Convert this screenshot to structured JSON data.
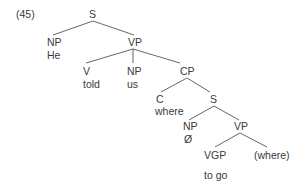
{
  "example_number": "(45)",
  "tree": {
    "S": {
      "label": "S"
    },
    "NP_subject": {
      "label": "NP",
      "word": "He"
    },
    "VP": {
      "label": "VP"
    },
    "V": {
      "label": "V",
      "word": "told"
    },
    "NP_object": {
      "label": "NP",
      "word": "us"
    },
    "CP": {
      "label": "CP"
    },
    "C": {
      "label": "C",
      "word": "where"
    },
    "S_embedded": {
      "label": "S"
    },
    "NP_null": {
      "label": "NP",
      "word": "Ø"
    },
    "VP_embedded": {
      "label": "VP"
    },
    "VGP": {
      "label": "VGP",
      "word": "to go"
    },
    "trace": {
      "label": "(where)"
    }
  },
  "colors": {
    "text": "#3a3a3a",
    "lines": "#555555",
    "background": "#ffffff"
  }
}
